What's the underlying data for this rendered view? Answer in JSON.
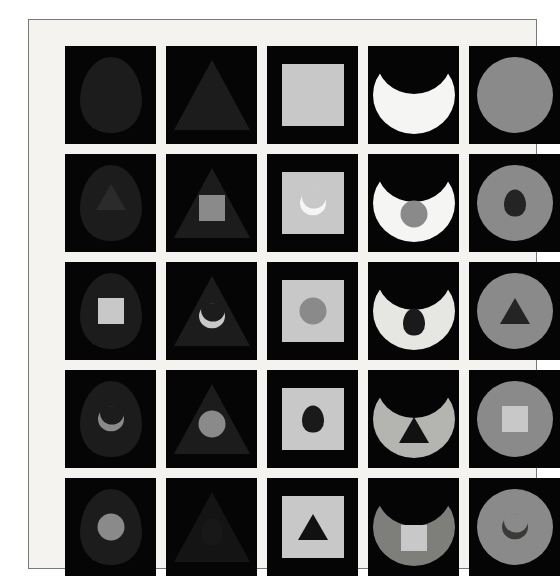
{
  "figure": {
    "rows": 5,
    "columns": 5,
    "background_color": "#f4f3f0",
    "frame_color": "#7a7874",
    "tile_background": "#050505"
  },
  "palette": {
    "black": "#050505",
    "near_black": "#111111",
    "dark_gray": "#242424",
    "mid_gray": "#8a8a8a",
    "light_gray": "#c8c8c8",
    "white": "#f5f5f3"
  },
  "columns": [
    {
      "index": 1,
      "outer_shape": "egg",
      "outer_color": "#1c1c1c"
    },
    {
      "index": 2,
      "outer_shape": "triangle",
      "outer_color": "#1c1c1c"
    },
    {
      "index": 3,
      "outer_shape": "square",
      "outer_color": "#c8c8c8"
    },
    {
      "index": 4,
      "outer_shape": "crescent",
      "outer_color": "#f5f5f3"
    },
    {
      "index": 5,
      "outer_shape": "circle",
      "outer_color": "#8a8a8a"
    }
  ],
  "rows": [
    {
      "index": 1,
      "inner_shape": "none"
    },
    {
      "index": 2,
      "inner_shape": "varies"
    },
    {
      "index": 3,
      "inner_shape": "varies"
    },
    {
      "index": 4,
      "inner_shape": "varies"
    },
    {
      "index": 5,
      "inner_shape": "varies"
    }
  ],
  "cells": [
    {
      "id": "r1c1",
      "row": 1,
      "col": 1,
      "outer": "egg",
      "outer_color": "#1c1c1c",
      "inner": "none",
      "inner_color": ""
    },
    {
      "id": "r1c2",
      "row": 1,
      "col": 2,
      "outer": "triangle",
      "outer_color": "#1c1c1c",
      "inner": "none",
      "inner_color": ""
    },
    {
      "id": "r1c3",
      "row": 1,
      "col": 3,
      "outer": "square",
      "outer_color": "#c8c8c8",
      "inner": "none",
      "inner_color": ""
    },
    {
      "id": "r1c4",
      "row": 1,
      "col": 4,
      "outer": "crescent",
      "outer_color": "#f5f5f3",
      "inner": "none",
      "inner_color": ""
    },
    {
      "id": "r1c5",
      "row": 1,
      "col": 5,
      "outer": "circle",
      "outer_color": "#8a8a8a",
      "inner": "none",
      "inner_color": ""
    },
    {
      "id": "r2c1",
      "row": 2,
      "col": 1,
      "outer": "egg",
      "outer_color": "#1c1c1c",
      "inner": "triangle",
      "inner_color": "#2b2b2b"
    },
    {
      "id": "r2c2",
      "row": 2,
      "col": 2,
      "outer": "triangle",
      "outer_color": "#1c1c1c",
      "inner": "square",
      "inner_color": "#8a8a8a"
    },
    {
      "id": "r2c3",
      "row": 2,
      "col": 3,
      "outer": "square",
      "outer_color": "#c8c8c8",
      "inner": "crescent",
      "inner_color": "#f5f5f3"
    },
    {
      "id": "r2c4",
      "row": 2,
      "col": 4,
      "outer": "crescent",
      "outer_color": "#f5f5f3",
      "inner": "circle",
      "inner_color": "#8a8a8a"
    },
    {
      "id": "r2c5",
      "row": 2,
      "col": 5,
      "outer": "circle",
      "outer_color": "#8a8a8a",
      "inner": "egg",
      "inner_color": "#242424"
    },
    {
      "id": "r3c1",
      "row": 3,
      "col": 1,
      "outer": "egg",
      "outer_color": "#1c1c1c",
      "inner": "square",
      "inner_color": "#c8c8c8"
    },
    {
      "id": "r3c2",
      "row": 3,
      "col": 2,
      "outer": "triangle",
      "outer_color": "#1c1c1c",
      "inner": "crescent",
      "inner_color": "#c8c8c8"
    },
    {
      "id": "r3c3",
      "row": 3,
      "col": 3,
      "outer": "square",
      "outer_color": "#c8c8c8",
      "inner": "circle",
      "inner_color": "#8a8a8a"
    },
    {
      "id": "r3c4",
      "row": 3,
      "col": 4,
      "outer": "crescent",
      "outer_color": "#e6e6e2",
      "inner": "egg",
      "inner_color": "#1a1a1a"
    },
    {
      "id": "r3c5",
      "row": 3,
      "col": 5,
      "outer": "circle",
      "outer_color": "#8a8a8a",
      "inner": "triangle",
      "inner_color": "#242424"
    },
    {
      "id": "r4c1",
      "row": 4,
      "col": 1,
      "outer": "egg",
      "outer_color": "#1c1c1c",
      "inner": "crescent",
      "inner_color": "#8a8a8a"
    },
    {
      "id": "r4c2",
      "row": 4,
      "col": 2,
      "outer": "triangle",
      "outer_color": "#1c1c1c",
      "inner": "circle",
      "inner_color": "#8a8a8a"
    },
    {
      "id": "r4c3",
      "row": 4,
      "col": 3,
      "outer": "square",
      "outer_color": "#c8c8c8",
      "inner": "egg",
      "inner_color": "#1a1a1a"
    },
    {
      "id": "r4c4",
      "row": 4,
      "col": 4,
      "outer": "crescent",
      "outer_color": "#b4b4b0",
      "inner": "triangle",
      "inner_color": "#111111"
    },
    {
      "id": "r4c5",
      "row": 4,
      "col": 5,
      "outer": "circle",
      "outer_color": "#8a8a8a",
      "inner": "square",
      "inner_color": "#c8c8c8"
    },
    {
      "id": "r5c1",
      "row": 5,
      "col": 1,
      "outer": "egg",
      "outer_color": "#1c1c1c",
      "inner": "circle",
      "inner_color": "#8a8a8a"
    },
    {
      "id": "r5c2",
      "row": 5,
      "col": 2,
      "outer": "triangle",
      "outer_color": "#141414",
      "inner": "egg",
      "inner_color": "#181818"
    },
    {
      "id": "r5c3",
      "row": 5,
      "col": 3,
      "outer": "square",
      "outer_color": "#c8c8c8",
      "inner": "triangle",
      "inner_color": "#111111"
    },
    {
      "id": "r5c4",
      "row": 5,
      "col": 4,
      "outer": "crescent",
      "outer_color": "#7e7e7a",
      "inner": "square",
      "inner_color": "#c8c8c8"
    },
    {
      "id": "r5c5",
      "row": 5,
      "col": 5,
      "outer": "circle",
      "outer_color": "#8a8a8a",
      "inner": "crescent",
      "inner_color": "#3a3a38"
    }
  ]
}
